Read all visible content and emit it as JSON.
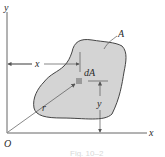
{
  "diagram": {
    "labels": {
      "y_axis": "y",
      "x_axis": "x",
      "origin": "O",
      "region": "A",
      "element": "dA",
      "x_dim": "x",
      "y_dim": "y",
      "radius": "r"
    },
    "caption": "Fig. 10–2",
    "colors": {
      "region_fill": "#d4d4d4",
      "region_stroke": "#444444",
      "element_fill": "#9a9a9a",
      "axis": "#555555"
    }
  }
}
